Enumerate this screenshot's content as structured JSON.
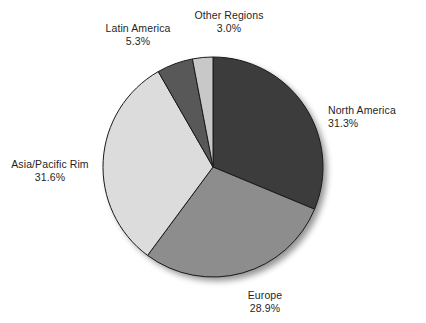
{
  "chart_data": {
    "type": "pie",
    "title": "",
    "subtitle": "",
    "xlabel": "",
    "ylabel": "",
    "legend_position": "none",
    "grid": false,
    "units": "percent",
    "start_angle_deg": 0,
    "direction": "clockwise",
    "categories": [
      "North America",
      "Europe",
      "Asia/Pacific Rim",
      "Latin America",
      "Other Regions"
    ],
    "values": [
      31.3,
      28.9,
      31.6,
      5.3,
      3.0
    ],
    "slices": [
      {
        "label": "North America",
        "value": 31.3,
        "value_text": "31.3%",
        "color": "#3c3c3c"
      },
      {
        "label": "Europe",
        "value": 28.9,
        "value_text": "28.9%",
        "color": "#8d8d8d"
      },
      {
        "label": "Asia/Pacific Rim",
        "value": 31.6,
        "value_text": "31.6%",
        "color": "#dcdcdc"
      },
      {
        "label": "Latin America",
        "value": 5.3,
        "value_text": "5.3%",
        "color": "#585858"
      },
      {
        "label": "Other Regions",
        "value": 3.0,
        "value_text": "3.0%",
        "color": "#c8c8c8"
      }
    ],
    "total": 100.1,
    "outline_color": "#1a1a1a",
    "background_color": "#ffffff",
    "text_color": "#1f1f1f"
  },
  "labels": {
    "north_america": {
      "name": "North America",
      "value": "31.3%"
    },
    "europe": {
      "name": "Europe",
      "value": "28.9%"
    },
    "asia_pacific": {
      "name": "Asia/Pacific Rim",
      "value": "31.6%"
    },
    "latin_america": {
      "name": "Latin America",
      "value": "5.3%"
    },
    "other_regions": {
      "name": "Other Regions",
      "value": "3.0%"
    }
  }
}
